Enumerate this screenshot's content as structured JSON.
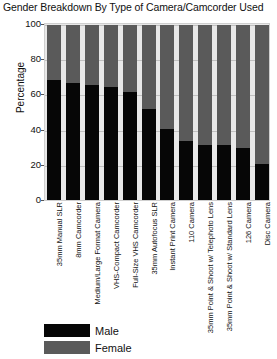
{
  "chart_data": {
    "type": "bar",
    "subtype": "stacked-100-percent",
    "title": "Gender Breakdown By Type of Camera/Camcorder Used",
    "xlabel": "",
    "ylabel": "Percentage",
    "ylim": [
      0,
      100
    ],
    "yticks": [
      0,
      20,
      40,
      60,
      80,
      100
    ],
    "ytick_labels": [
      "0",
      "20",
      "40",
      "60",
      "80",
      "100"
    ],
    "grid": true,
    "legend_position": "bottom-left",
    "categories": [
      "35mm Manual SLR",
      "8mm Camcorder",
      "Medium/Large Format Camera",
      "VHS-Compact Camcorder",
      "Full-Size VHS Camcorder",
      "35mm Autofocus SLR",
      "Instant Print Camera",
      "110 Camera",
      "35mm Point & Shoot w/ Telephoto Lens",
      "35mm Point & Shoot w/ Standard Lens",
      "126 Camera",
      "Disc Camera"
    ],
    "series": [
      {
        "name": "Male",
        "color": "#060606",
        "values": [
          69,
          67,
          66,
          65,
          62,
          52,
          41,
          34,
          32,
          32,
          30,
          21
        ]
      },
      {
        "name": "Female",
        "color": "#5a5a5a",
        "values": [
          31,
          33,
          34,
          35,
          38,
          48,
          59,
          66,
          68,
          68,
          70,
          79
        ]
      }
    ]
  },
  "legend": {
    "entries": [
      {
        "label": "Male",
        "color": "#060606"
      },
      {
        "label": "Female",
        "color": "#5a5a5a"
      }
    ]
  }
}
